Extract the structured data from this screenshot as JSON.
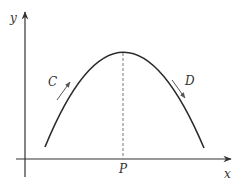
{
  "diagram": {
    "type": "concave-down curve on axes",
    "colors": {
      "axis": "#333333",
      "curve": "#2a2a2a",
      "dashed": "#777777",
      "arrow": "#555555",
      "background": "#ffffff"
    },
    "axes": {
      "y_label": "y",
      "x_label": "x"
    },
    "peak_label": "P",
    "left_label": "C",
    "right_label": "D",
    "annotations": [
      {
        "label": "C",
        "description": "arrow pointing up along the rising (left) side of the curve"
      },
      {
        "label": "D",
        "description": "arrow pointing down along the falling (right) side of the curve"
      },
      {
        "label": "P",
        "description": "x-position of the curve's maximum, marked with a dashed vertical line"
      }
    ]
  }
}
